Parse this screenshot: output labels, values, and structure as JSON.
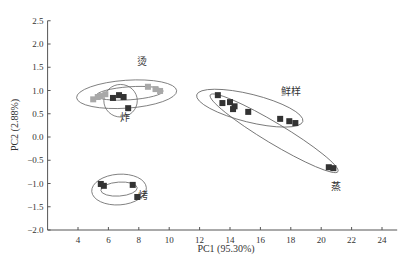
{
  "chart_data": {
    "type": "scatter",
    "title": "",
    "xlabel": "PC1 (95.30%)",
    "ylabel": "PC2 (2.88%)",
    "xlim": [
      2,
      25
    ],
    "ylim": [
      -2.0,
      2.5
    ],
    "xticks": [
      4,
      6,
      8,
      10,
      12,
      14,
      16,
      18,
      20,
      22,
      24
    ],
    "yticks": [
      "2.5",
      "2.0",
      "1.5",
      "1.0",
      "0.5",
      "0.0",
      "−0.5",
      "−1.0",
      "−1.5",
      "−2.0"
    ],
    "grid": false,
    "legend": "none (groups labeled inline)",
    "series": [
      {
        "name": "烫",
        "color": "#a8a8a8",
        "points": [
          [
            5.0,
            0.81
          ],
          [
            5.3,
            0.86
          ],
          [
            5.5,
            0.88
          ],
          [
            5.8,
            0.92
          ],
          [
            8.6,
            1.08
          ],
          [
            9.1,
            1.03
          ],
          [
            9.4,
            0.99
          ]
        ],
        "label_pos": [
          8.2,
          1.55
        ]
      },
      {
        "name": "炸",
        "color": "#333333",
        "points": [
          [
            6.3,
            0.84
          ],
          [
            6.7,
            0.9
          ],
          [
            7.0,
            0.86
          ],
          [
            7.3,
            0.62
          ]
        ],
        "label_pos": [
          7.1,
          0.35
        ]
      },
      {
        "name": "鲜样",
        "color": "#333333",
        "points": [
          [
            13.2,
            0.9
          ],
          [
            13.5,
            0.73
          ],
          [
            14.0,
            0.75
          ],
          [
            14.3,
            0.66
          ],
          [
            14.2,
            0.6
          ],
          [
            15.2,
            0.54
          ],
          [
            17.3,
            0.39
          ],
          [
            17.9,
            0.34
          ],
          [
            18.3,
            0.3
          ]
        ],
        "label_pos": [
          18.0,
          0.9
        ]
      },
      {
        "name": "蒸",
        "color": "#333333",
        "points": [
          [
            20.5,
            -0.65
          ],
          [
            20.8,
            -0.67
          ]
        ],
        "label_pos": [
          21.0,
          -1.13
        ]
      },
      {
        "name": "烤",
        "color": "#333333",
        "points": [
          [
            5.5,
            -1.01
          ],
          [
            5.7,
            -1.05
          ],
          [
            7.6,
            -1.03
          ],
          [
            7.9,
            -1.29
          ]
        ],
        "label_pos": [
          8.3,
          -1.33
        ]
      }
    ],
    "ellipses": [
      {
        "group": "烫-outer",
        "cx": 7.2,
        "cy": 0.92,
        "rx": 3.3,
        "ry": 0.3,
        "angle": -4
      },
      {
        "group": "烫-inner",
        "cx": 7.4,
        "cy": 0.94,
        "rx": 2.2,
        "ry": 0.14,
        "angle": -4
      },
      {
        "group": "炸",
        "cx": 6.8,
        "cy": 0.78,
        "rx": 1.1,
        "ry": 0.35,
        "angle": 0
      },
      {
        "group": "鲜样",
        "cx": 15.3,
        "cy": 0.62,
        "rx": 3.6,
        "ry": 0.3,
        "angle": 14
      },
      {
        "group": "鲜样+蒸",
        "cx": 16.9,
        "cy": 0.08,
        "rx": 4.9,
        "ry": 0.22,
        "angle": 31
      },
      {
        "group": "烤-outer",
        "cx": 6.7,
        "cy": -1.13,
        "rx": 1.8,
        "ry": 0.33,
        "angle": -4
      },
      {
        "group": "烤-inner",
        "cx": 6.7,
        "cy": -1.12,
        "rx": 1.2,
        "ry": 0.15,
        "angle": -4
      }
    ]
  }
}
